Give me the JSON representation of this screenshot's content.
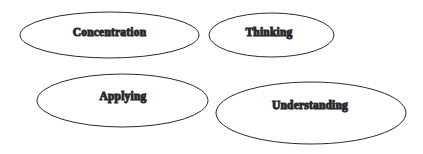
{
  "diagram": {
    "type": "ellipse-concept-set",
    "background_color": "#ffffff",
    "stroke_color": "#2b2b2b",
    "text_color": "#1a1a1a",
    "nodes": [
      {
        "id": "concentration",
        "label": "Concentration",
        "cx": 109.5,
        "cy": 35,
        "rx": 89.5,
        "ry": 23,
        "label_x": 109.5,
        "label_y": 33
      },
      {
        "id": "thinking",
        "label": "Thinking",
        "cx": 271.5,
        "cy": 35,
        "rx": 62.5,
        "ry": 22,
        "label_x": 269,
        "label_y": 33
      },
      {
        "id": "applying",
        "label": "Applying",
        "cx": 122.5,
        "cy": 100.5,
        "rx": 85.5,
        "ry": 26.5,
        "label_x": 123,
        "label_y": 97
      },
      {
        "id": "understanding",
        "label": "Understanding",
        "cx": 311,
        "cy": 113,
        "rx": 95,
        "ry": 31,
        "label_x": 310,
        "label_y": 106
      }
    ]
  }
}
